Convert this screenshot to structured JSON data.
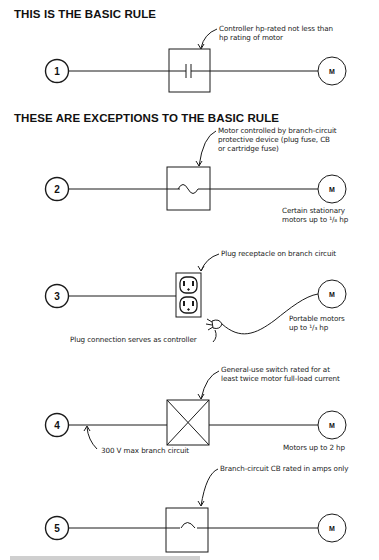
{
  "headings": {
    "basic": "THIS IS THE BASIC RULE",
    "exceptions": "THESE ARE EXCEPTIONS TO THE BASIC RULE"
  },
  "circuits": [
    {
      "number": "1",
      "motor_label": "M",
      "device": "contact-controller",
      "callout_line1": "Controller hp-rated not less than",
      "callout_line2": "hp rating of motor"
    },
    {
      "number": "2",
      "motor_label": "M",
      "device": "fuse",
      "callout_line1": "Motor controlled by branch-circuit",
      "callout_line2": "protective device (plug fuse, CB",
      "callout_line3": "or cartridge fuse)",
      "motor_note_line1": "Certain stationary",
      "motor_note_line2": "motors up to ¹/₈ hp"
    },
    {
      "number": "3",
      "motor_label": "M",
      "device": "plug-receptacle",
      "callout_line1": "Plug receptacle on branch circuit",
      "plug_note": "Plug connection serves as controller",
      "motor_note_line1": "Portable motors",
      "motor_note_line2": "up to ¹/₃ hp"
    },
    {
      "number": "4",
      "motor_label": "M",
      "device": "general-use-switch",
      "callout_line1": "General-use switch rated for at",
      "callout_line2": "least twice motor full-load current",
      "line_note": "300 V max branch circuit",
      "motor_note_line1": "Motors up to 2 hp"
    },
    {
      "number": "5",
      "motor_label": "M",
      "device": "circuit-breaker",
      "callout_line1": "Branch-circuit CB rated in amps only"
    }
  ],
  "caption": {
    "text": "Fig. 180.24 Controller..."
  }
}
